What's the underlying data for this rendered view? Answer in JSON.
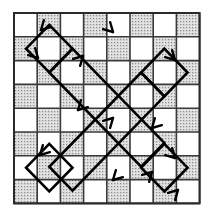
{
  "figure": {
    "type": "diagram",
    "background_color": "#ffffff"
  },
  "board": {
    "name": "checkerboard",
    "rows": 8,
    "cols": 8,
    "origin_x": 14,
    "origin_y": 13,
    "cell_width": 23.2,
    "cell_height": 23.8,
    "light_color": "#ffffff",
    "dark_color": "#d9d9d9",
    "dark_dot_color": "#8f8f8f",
    "grid_line_color": "#3a3a3a",
    "grid_line_width": 1.6,
    "border_color": "#2a2a2a",
    "border_width": 2.0,
    "pattern_note": "standard alternating checkerboard, top-left cell is light",
    "shaded_cells": [
      [
        0,
        1
      ],
      [
        0,
        3
      ],
      [
        0,
        5
      ],
      [
        0,
        7
      ],
      [
        1,
        0
      ],
      [
        1,
        2
      ],
      [
        1,
        4
      ],
      [
        1,
        6
      ],
      [
        2,
        1
      ],
      [
        2,
        3
      ],
      [
        2,
        5
      ],
      [
        2,
        7
      ],
      [
        3,
        0
      ],
      [
        3,
        2
      ],
      [
        3,
        4
      ],
      [
        3,
        6
      ],
      [
        4,
        1
      ],
      [
        4,
        3
      ],
      [
        4,
        5
      ],
      [
        4,
        7
      ],
      [
        5,
        0
      ],
      [
        5,
        2
      ],
      [
        5,
        4
      ],
      [
        5,
        6
      ],
      [
        6,
        1
      ],
      [
        6,
        3
      ],
      [
        6,
        5
      ],
      [
        6,
        7
      ],
      [
        7,
        0
      ],
      [
        7,
        2
      ],
      [
        7,
        4
      ],
      [
        7,
        6
      ]
    ]
  },
  "path": {
    "name": "closed-tour-path",
    "stroke_color": "#000000",
    "stroke_width": 2.6,
    "closed": true,
    "segment_angle_degrees": 45,
    "vertices": [
      [
        49.0,
        25.0
      ],
      [
        25.0,
        49.0
      ],
      [
        37.0,
        61.0
      ],
      [
        49.0,
        73.0
      ],
      [
        61.0,
        61.0
      ],
      [
        37.0,
        37.0
      ],
      [
        49.0,
        25.0
      ]
    ],
    "loops": [
      {
        "name": "upper-left-lobe",
        "points": [
          [
            49,
            25
          ],
          [
            25,
            49
          ],
          [
            49,
            73
          ],
          [
            61,
            61
          ],
          [
            37,
            37
          ]
        ]
      },
      {
        "name": "main-band",
        "points": [
          [
            49,
            25
          ],
          [
            168,
            144
          ],
          [
            192,
            168
          ],
          [
            168,
            192
          ],
          [
            144,
            168
          ],
          [
            25,
            49
          ]
        ]
      }
    ],
    "polyline": [
      [
        49.0,
        25.0
      ],
      [
        25.0,
        49.0
      ],
      [
        49.0,
        73.0
      ],
      [
        61.0,
        61.0
      ],
      [
        168.0,
        168.0
      ],
      [
        192.0,
        144.0
      ],
      [
        168.0,
        120.0
      ],
      [
        61.0,
        13.0
      ]
    ],
    "outline_points": [
      [
        46,
        26
      ],
      [
        26,
        46
      ],
      [
        26,
        50
      ],
      [
        50,
        74
      ],
      [
        60,
        64
      ],
      [
        168,
        172
      ],
      [
        190,
        150
      ],
      [
        190,
        146
      ],
      [
        166,
        122
      ],
      [
        156,
        132
      ],
      [
        48,
        24
      ]
    ]
  },
  "arrows": {
    "name": "direction-arrowheads",
    "color": "#000000",
    "size": 9,
    "markers": [
      {
        "id": "arrow-top-left-down",
        "x": 41,
        "y": 30,
        "angle": 135,
        "label": "down-left"
      },
      {
        "id": "arrow-left-upper-down",
        "x": 38,
        "y": 58,
        "angle": 45,
        "label": "down-right"
      },
      {
        "id": "arrow-upper-diag-up",
        "x": 83,
        "y": 56,
        "angle": 315,
        "label": "up-right"
      },
      {
        "id": "arrow-top-right-peak",
        "x": 113,
        "y": 32,
        "angle": 45,
        "label": "down-right"
      },
      {
        "id": "arrow-mid-left-down",
        "x": 78,
        "y": 110,
        "angle": 135,
        "label": "down-left"
      },
      {
        "id": "arrow-center-up",
        "x": 113,
        "y": 118,
        "angle": 315,
        "label": "up-right"
      },
      {
        "id": "arrow-right-upper",
        "x": 175,
        "y": 60,
        "angle": 45,
        "label": "down-right"
      },
      {
        "id": "arrow-right-mid-down",
        "x": 152,
        "y": 128,
        "angle": 135,
        "label": "down-left"
      },
      {
        "id": "arrow-left-lower-down",
        "x": 40,
        "y": 155,
        "angle": 135,
        "label": "down-left"
      },
      {
        "id": "arrow-bottom-mid",
        "x": 113,
        "y": 180,
        "angle": 135,
        "label": "down-left"
      },
      {
        "id": "arrow-lower-right-up",
        "x": 152,
        "y": 172,
        "angle": 315,
        "label": "up-right"
      },
      {
        "id": "arrow-bottom-right-peak",
        "x": 175,
        "y": 158,
        "angle": 45,
        "label": "down-right"
      },
      {
        "id": "arrow-bottom-right-end",
        "x": 178,
        "y": 190,
        "angle": 315,
        "label": "up-right"
      }
    ]
  }
}
